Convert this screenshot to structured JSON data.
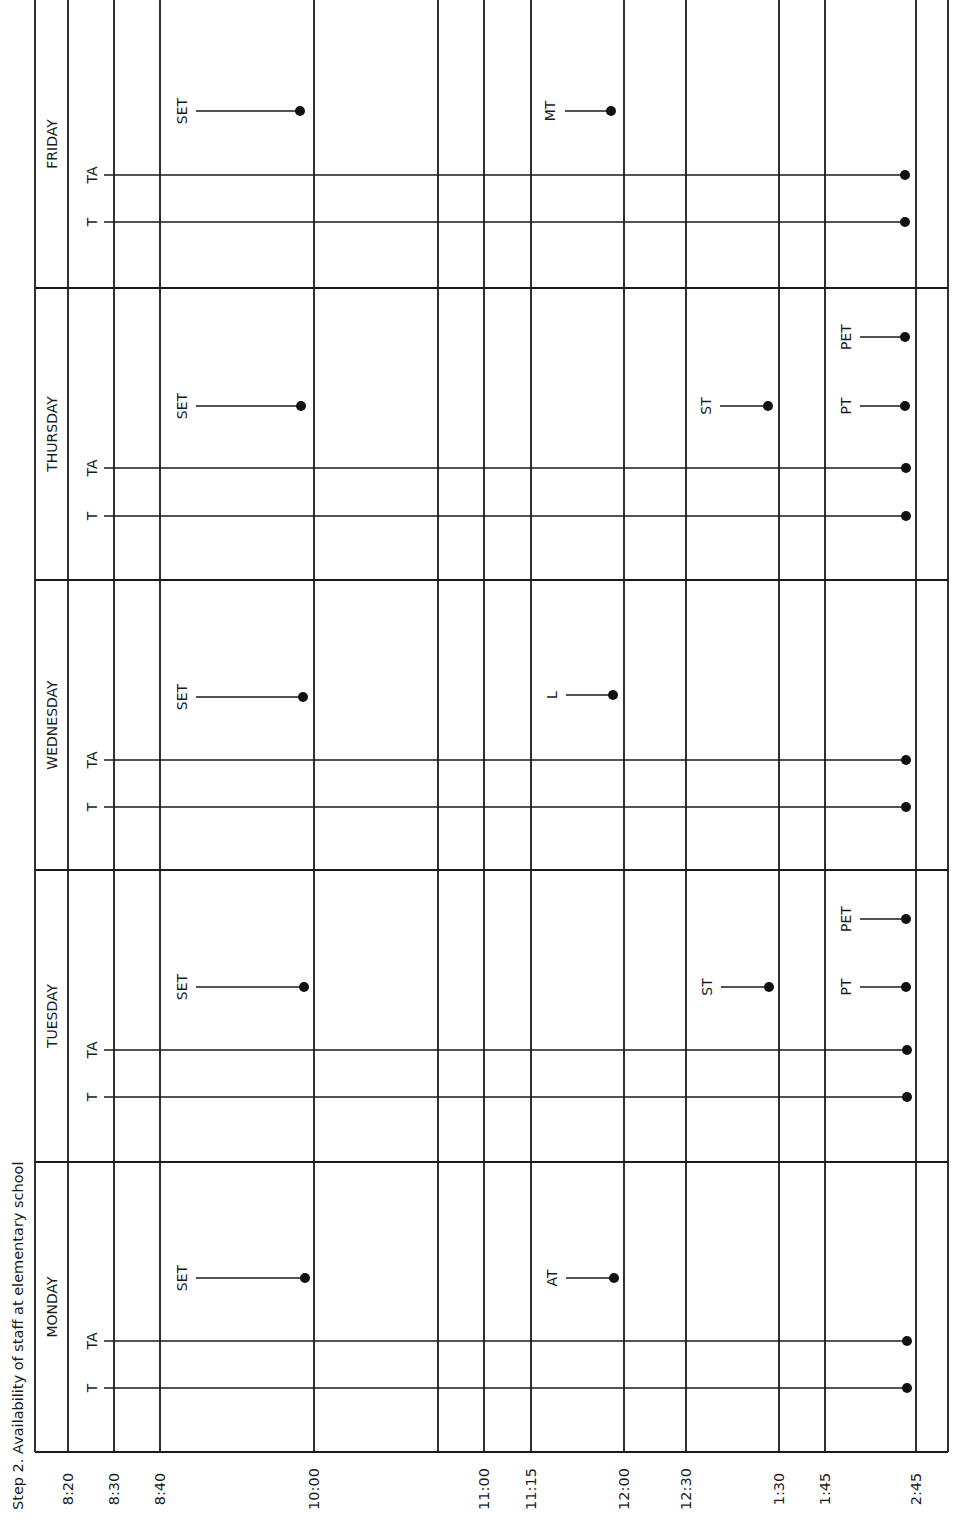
{
  "title": "Step 2.   Availability of staff at elementary school",
  "chart_data": {
    "type": "timeline",
    "title": "Step 2. Availability of staff at elementary school",
    "orientation": "rotated 90° counter-clockwise (time axis runs left-to-right along the bottom edge)",
    "time_ticks": [
      "8:20",
      "8:30",
      "8:40",
      "10:00",
      "11:00",
      "11:15",
      "12:00",
      "12:30",
      "1:30",
      "1:45",
      "2:45"
    ],
    "days": [
      "MONDAY",
      "TUESDAY",
      "WEDNESDAY",
      "THURSDAY",
      "FRIDAY"
    ],
    "staff_key": {
      "T": "teacher",
      "TA": "teacher aide",
      "SET": "special education teacher",
      "AT": "art teacher",
      "ST": "speech therapist",
      "PT": "physical therapist",
      "PET": "physical education teacher",
      "L": "librarian",
      "MT": "music teacher"
    },
    "availability": [
      {
        "day": "MONDAY",
        "staff": [
          {
            "label": "T",
            "from": "8:20",
            "to": "2:45"
          },
          {
            "label": "TA",
            "from": "8:20",
            "to": "2:45"
          },
          {
            "label": "SET",
            "from": "8:40",
            "to": "10:00"
          },
          {
            "label": "AT",
            "from": "11:15",
            "to": "12:00"
          }
        ]
      },
      {
        "day": "TUESDAY",
        "staff": [
          {
            "label": "T",
            "from": "8:20",
            "to": "2:45"
          },
          {
            "label": "TA",
            "from": "8:20",
            "to": "2:45"
          },
          {
            "label": "SET",
            "from": "8:40",
            "to": "10:00"
          },
          {
            "label": "ST",
            "from": "12:30",
            "to": "1:30"
          },
          {
            "label": "PT",
            "from": "1:45",
            "to": "2:45"
          },
          {
            "label": "PET",
            "from": "1:45",
            "to": "2:45"
          }
        ]
      },
      {
        "day": "WEDNESDAY",
        "staff": [
          {
            "label": "T",
            "from": "8:20",
            "to": "2:45"
          },
          {
            "label": "TA",
            "from": "8:20",
            "to": "2:45"
          },
          {
            "label": "SET",
            "from": "8:40",
            "to": "10:00"
          },
          {
            "label": "L",
            "from": "11:15",
            "to": "12:00"
          }
        ]
      },
      {
        "day": "THURSDAY",
        "staff": [
          {
            "label": "T",
            "from": "8:20",
            "to": "2:45"
          },
          {
            "label": "TA",
            "from": "8:20",
            "to": "2:45"
          },
          {
            "label": "SET",
            "from": "8:40",
            "to": "10:00"
          },
          {
            "label": "ST",
            "from": "12:30",
            "to": "1:30"
          },
          {
            "label": "PT",
            "from": "1:45",
            "to": "2:45"
          },
          {
            "label": "PET",
            "from": "1:45",
            "to": "2:45"
          }
        ]
      },
      {
        "day": "FRIDAY",
        "staff": [
          {
            "label": "T",
            "from": "8:20",
            "to": "2:45"
          },
          {
            "label": "TA",
            "from": "8:20",
            "to": "2:45"
          },
          {
            "label": "SET",
            "from": "8:40",
            "to": "10:00"
          },
          {
            "label": "MT",
            "from": "11:15",
            "to": "12:00"
          }
        ]
      }
    ]
  },
  "layout": {
    "time_x": {
      "8:20": 68,
      "8:30": 114,
      "8:40": 160,
      "10:00": 314,
      "unlabeled": 438,
      "11:00": 484,
      "11:15": 531,
      "12:00": 624,
      "12:30": 686,
      "1:30": 779,
      "1:45": 825,
      "2:45": 916
    },
    "left_border": 35,
    "right_border": 948,
    "bottom_border": 1452,
    "day_separators": [
      288,
      580,
      870,
      1162
    ],
    "day_label_y": {
      "FRIDAY": 144,
      "THURSDAY": 434,
      "WEDNESDAY": 725,
      "TUESDAY": 1016,
      "MONDAY": 1307
    },
    "bars": [
      {
        "day": "FRIDAY",
        "label": "T",
        "y": 222,
        "x1": 104,
        "x2": 905,
        "lx": 92
      },
      {
        "day": "FRIDAY",
        "label": "TA",
        "y": 175,
        "x1": 104,
        "x2": 905,
        "lx": 92
      },
      {
        "day": "FRIDAY",
        "label": "SET",
        "y": 111,
        "x1": 196,
        "x2": 300,
        "lx": 182
      },
      {
        "day": "FRIDAY",
        "label": "MT",
        "y": 111,
        "x1": 565,
        "x2": 611,
        "lx": 550
      },
      {
        "day": "THURSDAY",
        "label": "T",
        "y": 516,
        "x1": 104,
        "x2": 906,
        "lx": 92
      },
      {
        "day": "THURSDAY",
        "label": "TA",
        "y": 468,
        "x1": 104,
        "x2": 906,
        "lx": 92
      },
      {
        "day": "THURSDAY",
        "label": "SET",
        "y": 406,
        "x1": 196,
        "x2": 301,
        "lx": 182
      },
      {
        "day": "THURSDAY",
        "label": "ST",
        "y": 406,
        "x1": 720,
        "x2": 768,
        "lx": 706
      },
      {
        "day": "THURSDAY",
        "label": "PT",
        "y": 406,
        "x1": 860,
        "x2": 905,
        "lx": 846
      },
      {
        "day": "THURSDAY",
        "label": "PET",
        "y": 337,
        "x1": 860,
        "x2": 905,
        "lx": 846
      },
      {
        "day": "WEDNESDAY",
        "label": "T",
        "y": 807,
        "x1": 104,
        "x2": 906,
        "lx": 92
      },
      {
        "day": "WEDNESDAY",
        "label": "TA",
        "y": 760,
        "x1": 104,
        "x2": 906,
        "lx": 92
      },
      {
        "day": "WEDNESDAY",
        "label": "SET",
        "y": 697,
        "x1": 196,
        "x2": 303,
        "lx": 182
      },
      {
        "day": "WEDNESDAY",
        "label": "L",
        "y": 695,
        "x1": 566,
        "x2": 613,
        "lx": 552
      },
      {
        "day": "TUESDAY",
        "label": "T",
        "y": 1097,
        "x1": 104,
        "x2": 907,
        "lx": 92
      },
      {
        "day": "TUESDAY",
        "label": "TA",
        "y": 1050,
        "x1": 104,
        "x2": 907,
        "lx": 92
      },
      {
        "day": "TUESDAY",
        "label": "SET",
        "y": 987,
        "x1": 196,
        "x2": 304,
        "lx": 182
      },
      {
        "day": "TUESDAY",
        "label": "ST",
        "y": 987,
        "x1": 721,
        "x2": 769,
        "lx": 707
      },
      {
        "day": "TUESDAY",
        "label": "PT",
        "y": 987,
        "x1": 860,
        "x2": 906,
        "lx": 846
      },
      {
        "day": "TUESDAY",
        "label": "PET",
        "y": 919,
        "x1": 860,
        "x2": 906,
        "lx": 846
      },
      {
        "day": "MONDAY",
        "label": "T",
        "y": 1388,
        "x1": 104,
        "x2": 907,
        "lx": 92
      },
      {
        "day": "MONDAY",
        "label": "TA",
        "y": 1341,
        "x1": 104,
        "x2": 907,
        "lx": 92
      },
      {
        "day": "MONDAY",
        "label": "SET",
        "y": 1278,
        "x1": 196,
        "x2": 305,
        "lx": 182
      },
      {
        "day": "MONDAY",
        "label": "AT",
        "y": 1278,
        "x1": 566,
        "x2": 614,
        "lx": 552
      }
    ]
  }
}
